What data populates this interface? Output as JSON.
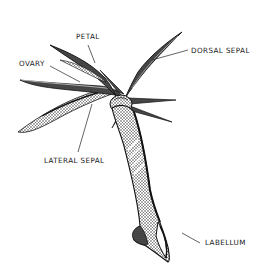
{
  "diagram": {
    "labels": {
      "petal": "PETAL",
      "ovary": "OVARY",
      "dorsal_sepal": "DORSAL SEPAL",
      "lateral_sepal": "LATERAL SEPAL",
      "labellum": "LABELLUM"
    },
    "colors": {
      "ink": "#1a1a1a",
      "background": "#ffffff"
    }
  }
}
